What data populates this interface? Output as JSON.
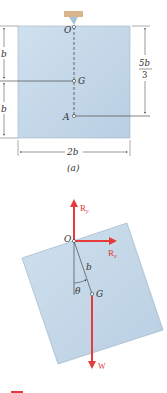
{
  "figure_a": {
    "caption": "(a)",
    "points": {
      "O": "O",
      "G": "G",
      "A": "A"
    },
    "dimensions": {
      "left_upper": "b",
      "left_lower": "b",
      "right_num": "5b",
      "right_den": "3",
      "bottom": "2b"
    }
  },
  "figure_b": {
    "points": {
      "O": "O",
      "G": "G"
    },
    "length_label": "b",
    "angle_label": "θ",
    "forces": {
      "Ry": {
        "label": "R",
        "sub": "y"
      },
      "Rx": {
        "label": "R",
        "sub": "x"
      },
      "W": {
        "label": "W"
      }
    }
  },
  "colors": {
    "plate": "#c5d8e8",
    "plate_edge": "#8aa4b8",
    "force": "#e63b3b",
    "support": "#d9b48c",
    "line": "#333333"
  }
}
